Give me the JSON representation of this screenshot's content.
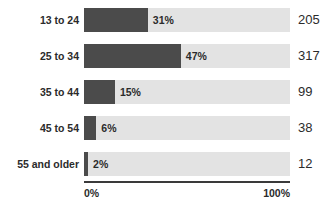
{
  "chart_data": {
    "type": "bar",
    "orientation": "horizontal",
    "title": "",
    "subtitle": "",
    "xlabel": "",
    "ylabel": "",
    "grid": false,
    "legend": null,
    "xlim": [
      0,
      100
    ],
    "axis_ticks": [
      "0%",
      "100%"
    ],
    "categories": [
      "13 to 24",
      "25 to 34",
      "35 to 44",
      "45 to 54",
      "55 and older"
    ],
    "values": [
      31,
      47,
      15,
      6,
      2
    ],
    "value_labels": [
      "31%",
      "47%",
      "15%",
      "6%",
      "2%"
    ],
    "counts": [
      205,
      317,
      99,
      38,
      12
    ],
    "count_labels": [
      "205",
      "317",
      "99",
      "38",
      "12"
    ],
    "bar_color": "#4b4b4b",
    "track_color": "#e3e3e3",
    "axis_color": "#3a3a3a",
    "text_color": "#2b2b2b"
  },
  "rows": [
    {
      "label": "13 to 24",
      "pct": 31,
      "pct_label": "31%",
      "count": "205"
    },
    {
      "label": "25 to 34",
      "pct": 47,
      "pct_label": "47%",
      "count": "317"
    },
    {
      "label": "35 to 44",
      "pct": 15,
      "pct_label": "15%",
      "count": "99"
    },
    {
      "label": "45 to 54",
      "pct": 6,
      "pct_label": "6%",
      "count": "38"
    },
    {
      "label": "55 and older",
      "pct": 2,
      "pct_label": "2%",
      "count": "12"
    }
  ],
  "axis": {
    "min_label": "0%",
    "max_label": "100%"
  }
}
